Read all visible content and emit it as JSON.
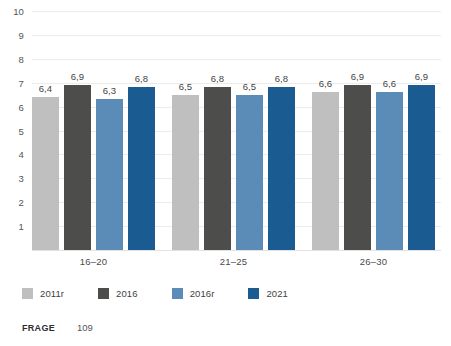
{
  "chart_data": {
    "type": "bar",
    "title": "",
    "subtitle": "",
    "xlabel": "",
    "ylabel": "",
    "ylim": [
      0,
      10
    ],
    "y_ticks": [
      1,
      2,
      3,
      4,
      5,
      6,
      7,
      8,
      9,
      10
    ],
    "y_tick_labels": [
      "1",
      "2",
      "3",
      "4",
      "5",
      "6",
      "7",
      "8",
      "9",
      "10"
    ],
    "grid": true,
    "legend_position": "bottom-left",
    "categories": [
      "16–20",
      "21–25",
      "26–30"
    ],
    "series": [
      {
        "name": "2011r",
        "color": "#bfbfbf",
        "values": [
          6.4,
          6.5,
          6.6
        ],
        "labels": [
          "6,4",
          "6,5",
          "6,6"
        ]
      },
      {
        "name": "2016",
        "color": "#4d4d4b",
        "values": [
          6.9,
          6.8,
          6.9
        ],
        "labels": [
          "6,9",
          "6,8",
          "6,9"
        ]
      },
      {
        "name": "2016r",
        "color": "#5b8cb8",
        "values": [
          6.3,
          6.5,
          6.6
        ],
        "labels": [
          "6,3",
          "6,5",
          "6,6"
        ]
      },
      {
        "name": "2021",
        "color": "#1a5c91",
        "values": [
          6.8,
          6.8,
          6.9
        ],
        "labels": [
          "6,8",
          "6,8",
          "6,9"
        ]
      }
    ]
  },
  "legend": {
    "items": [
      {
        "label": "2011r",
        "color": "#bfbfbf"
      },
      {
        "label": "2016",
        "color": "#4d4d4b"
      },
      {
        "label": "2016r",
        "color": "#5b8cb8"
      },
      {
        "label": "2021",
        "color": "#1a5c91"
      }
    ]
  },
  "footer": {
    "label": "FRAGE",
    "value": "109"
  },
  "colors": {
    "gridline": "#ececec",
    "axis_text": "#555555",
    "label_text": "#3f3f3f",
    "background": "#ffffff"
  }
}
